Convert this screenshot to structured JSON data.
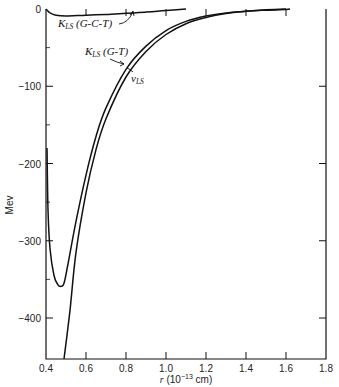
{
  "chart_data": {
    "type": "line",
    "title": "",
    "xlabel": "r (10^-13 cm)",
    "ylabel": "Mev",
    "xlim": [
      0.4,
      1.8
    ],
    "ylim": [
      -453,
      0
    ],
    "xticks": [
      0.4,
      0.6,
      0.8,
      1.0,
      1.2,
      1.4,
      1.6,
      1.8
    ],
    "xtick_labels": [
      "0.4",
      "0.6",
      "0.8",
      "1.0",
      "1.2",
      "1.4",
      "1.6",
      "1.8"
    ],
    "yticks": [
      0,
      -100,
      -200,
      -300,
      -400
    ],
    "ytick_labels": [
      "0",
      "−100",
      "−200",
      "−300",
      "−400"
    ],
    "grid": false,
    "legend": "none (curves labeled inline)",
    "series": [
      {
        "name": "K_LS (G-C-T)",
        "label_main": "K",
        "label_sub": "LS",
        "label_tail": " (G-C-T)",
        "x": [
          0.4,
          0.42,
          0.45,
          0.5,
          0.6,
          0.7,
          0.8,
          0.9,
          1.0,
          1.1
        ],
        "y": [
          0,
          -5,
          -8,
          -9,
          -8,
          -7,
          -5.5,
          -4,
          -2,
          0
        ]
      },
      {
        "name": "K_LS (G-T)",
        "label_main": "K",
        "label_sub": "LS",
        "label_tail": " (G-T)",
        "x": [
          0.405,
          0.41,
          0.42,
          0.44,
          0.46,
          0.475,
          0.49,
          0.51,
          0.55,
          0.6,
          0.65,
          0.7,
          0.8,
          0.9,
          1.0,
          1.1,
          1.2,
          1.3,
          1.4,
          1.5,
          1.6
        ],
        "y": [
          -180,
          -260,
          -310,
          -345,
          -357,
          -359,
          -355,
          -330,
          -275,
          -215,
          -165,
          -128,
          -78,
          -48,
          -28,
          -16,
          -9,
          -5,
          -3,
          -1,
          0
        ]
      },
      {
        "name": "v_LS",
        "label_main": "v",
        "label_sub": "LS",
        "label_tail": "",
        "x": [
          0.49,
          0.52,
          0.55,
          0.6,
          0.65,
          0.7,
          0.8,
          0.9,
          1.0,
          1.1,
          1.2,
          1.3,
          1.4,
          1.5,
          1.6,
          1.62
        ],
        "y": [
          -453,
          -390,
          -315,
          -238,
          -182,
          -142,
          -88,
          -55,
          -33,
          -19,
          -11,
          -6,
          -3,
          -1.5,
          -0.5,
          0
        ]
      }
    ],
    "annotations": [
      {
        "text": "K_LS (G-C-T)",
        "arrow_to": [
          0.83,
          -5
        ]
      },
      {
        "text": "K_LS (G-T)",
        "arrow_to": [
          0.8,
          -75
        ]
      },
      {
        "text": "v_LS",
        "arrow_to": [
          0.84,
          -86
        ]
      }
    ]
  }
}
